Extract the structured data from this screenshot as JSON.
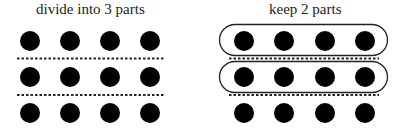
{
  "left_panel": {
    "title": "divide into 3 parts",
    "rows": 3,
    "cols": 4,
    "dividers": 2
  },
  "right_panel": {
    "title": "keep 2 parts",
    "rows": 3,
    "cols": 4,
    "dividers": 2,
    "highlighted_rows": [
      1,
      2
    ]
  },
  "colors": {
    "dot": "#000000",
    "line": "#222222"
  }
}
